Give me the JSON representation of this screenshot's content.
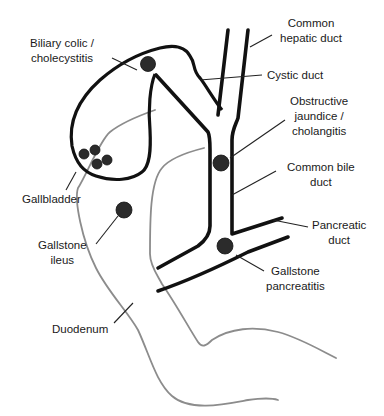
{
  "diagram": {
    "colors": {
      "duct_stroke": "#111111",
      "duodenum_stroke": "#8c8c8c",
      "stone_fill": "#2b2b2b",
      "background": "#ffffff"
    },
    "labels": {
      "biliary_colic": {
        "line1": "Biliary colic /",
        "line2": "cholecystitis"
      },
      "common_hepatic_duct": {
        "line1": "Common",
        "line2": "hepatic duct"
      },
      "cystic_duct": {
        "line1": "Cystic duct"
      },
      "obstructive_jaundice": {
        "line1": "Obstructive",
        "line2": "jaundice /",
        "line3": "cholangitis"
      },
      "common_bile_duct": {
        "line1": "Common bile",
        "line2": "duct"
      },
      "gallbladder": {
        "line1": "Gallbladder"
      },
      "pancreatic_duct": {
        "line1": "Pancreatic",
        "line2": "duct"
      },
      "gallstone_ileus": {
        "line1": "Gallstone",
        "line2": "ileus"
      },
      "gallstone_pancreatitis": {
        "line1": "Gallstone",
        "line2": "pancreatitis"
      },
      "duodenum": {
        "line1": "Duodenum"
      }
    },
    "stones": [
      {
        "site": "gallbladder neck",
        "label_ref": "biliary_colic"
      },
      {
        "site": "common bile duct",
        "label_ref": "obstructive_jaundice"
      },
      {
        "site": "ampulla",
        "label_ref": "gallstone_pancreatitis"
      },
      {
        "site": "duodenum/bowel",
        "label_ref": "gallstone_ileus"
      },
      {
        "site": "gallbladder body",
        "count": 4
      }
    ]
  }
}
